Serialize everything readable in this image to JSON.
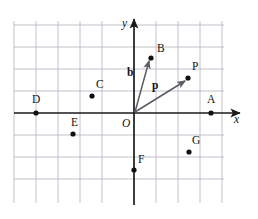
{
  "figure": {
    "title": "",
    "background_color": "#ffffff",
    "grid_color": "#b9b9c4",
    "axis_color": "#1a1a1a",
    "vector_color": "#5b5b66",
    "point_color": "#111111"
  },
  "chart_data": {
    "type": "scatter",
    "title": "",
    "xlabel": "x",
    "ylabel": "y",
    "grid": true,
    "legend": "none",
    "xlim": [
      -5.5,
      4.1
    ],
    "ylim": [
      -3.5,
      4.0
    ],
    "grid_spacing": 1,
    "origin_label": "O",
    "points": [
      {
        "label": "A",
        "x": 3.5,
        "y": 0.0,
        "px": 211,
        "py": 113,
        "lx": 207,
        "ly": 103
      },
      {
        "label": "B",
        "x": 0.75,
        "y": 2.5,
        "px": 151,
        "py": 58,
        "lx": 157,
        "ly": 52
      },
      {
        "label": "C",
        "x": -2.0,
        "y": 0.75,
        "px": 92,
        "py": 96,
        "lx": 96,
        "ly": 88
      },
      {
        "label": "D",
        "x": -4.5,
        "y": 0.0,
        "px": 36,
        "py": 113,
        "lx": 32,
        "ly": 103
      },
      {
        "label": "E",
        "x": -2.75,
        "y": -1.0,
        "px": 73,
        "py": 134,
        "lx": 71,
        "ly": 126
      },
      {
        "label": "F",
        "x": 0.0,
        "y": -2.5,
        "px": 134,
        "py": 170,
        "lx": 138,
        "ly": 163
      },
      {
        "label": "G",
        "x": 2.5,
        "y": -1.75,
        "px": 189,
        "py": 152,
        "lx": 192,
        "ly": 144
      },
      {
        "label": "P",
        "x": 2.5,
        "y": 1.5,
        "px": 188,
        "py": 78,
        "lx": 192,
        "ly": 70
      }
    ],
    "vectors": [
      {
        "label": "b",
        "from": [
          0,
          0
        ],
        "to": [
          0.75,
          2.5
        ],
        "from_px": [
          135,
          112
        ],
        "to_px": [
          149,
          61
        ],
        "label_px": [
          127,
          76
        ]
      },
      {
        "label": "p",
        "from": [
          0,
          0
        ],
        "to": [
          2.5,
          1.5
        ],
        "from_px": [
          135,
          112
        ],
        "to_px": [
          185,
          81
        ],
        "label_px": [
          152,
          89
        ]
      }
    ],
    "axes": {
      "x_axis": {
        "label": "x",
        "label_px": [
          234,
          123
        ],
        "start_px": [
          14,
          113
        ],
        "end_px": [
          240,
          113
        ]
      },
      "y_axis": {
        "label": "y",
        "label_px": [
          122,
          27
        ],
        "start_px": [
          134,
          205
        ],
        "end_px": [
          134,
          19
        ]
      },
      "origin": {
        "label": "O",
        "label_px": [
          122,
          127
        ]
      }
    },
    "gridlines": {
      "vertical_x_px": [
        14,
        36,
        58,
        80,
        102,
        156,
        178,
        200,
        222
      ],
      "horizontal_y_px": [
        25,
        47,
        69,
        91,
        135,
        157,
        179
      ],
      "v_top_px": 21,
      "v_bottom_px": 203,
      "h_left_px": 14,
      "h_right_px": 224
    }
  }
}
